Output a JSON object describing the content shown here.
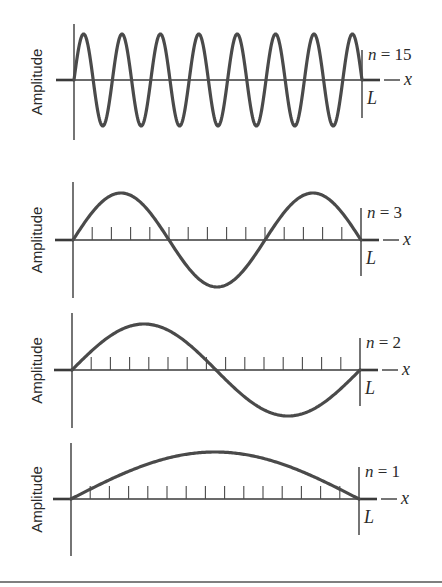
{
  "figure": {
    "y_axis_label": "Amplitude",
    "x_axis_label": "x",
    "length_label": "L",
    "colors": {
      "curve": "#4a4a4a",
      "axes": "#3a3a3a",
      "text": "#2a2a2a",
      "background": "#ffffff"
    }
  },
  "panels": [
    {
      "id": "n15",
      "mode_label_var": "n",
      "mode_label_eq": " = 15",
      "n": 15,
      "baseline_y": 80,
      "axis_x0": 74,
      "axis_x1": 362,
      "axis_top": 24,
      "axis_bottom": 140,
      "L_top": 50,
      "L_bottom": 118,
      "amplitude_px": 46,
      "ticks": false
    },
    {
      "id": "n3",
      "mode_label_var": "n",
      "mode_label_eq": " = 3",
      "n": 3,
      "baseline_y": 240,
      "axis_x0": 73,
      "axis_x1": 361,
      "axis_top": 182,
      "axis_bottom": 298,
      "L_top": 208,
      "L_bottom": 276,
      "amplitude_px": 47,
      "ticks": true
    },
    {
      "id": "n2",
      "mode_label_var": "n",
      "mode_label_eq": " = 2",
      "n": 2,
      "baseline_y": 370,
      "axis_x0": 72,
      "axis_x1": 360,
      "axis_top": 313,
      "axis_bottom": 428,
      "L_top": 338,
      "L_bottom": 406,
      "amplitude_px": 46,
      "ticks": true
    },
    {
      "id": "n1",
      "mode_label_var": "n",
      "mode_label_eq": " = 1",
      "n": 1,
      "baseline_y": 499,
      "axis_x0": 71,
      "axis_x1": 359,
      "axis_top": 443,
      "axis_bottom": 556,
      "L_top": 467,
      "L_bottom": 535,
      "amplitude_px": 47,
      "ticks": true
    }
  ],
  "tick_divisions": 15,
  "chart_data": {
    "type": "line",
    "title": "",
    "xlabel": "x",
    "ylabel": "Amplitude",
    "x_range": [
      0,
      "L"
    ],
    "series": [
      {
        "name": "n = 15",
        "function": "sin(15*pi*x/L)",
        "half_wavelengths": 15,
        "nodes": 16,
        "antinodes": 15
      },
      {
        "name": "n = 3",
        "function": "sin(3*pi*x/L)",
        "half_wavelengths": 3,
        "nodes": 4,
        "antinodes": 3
      },
      {
        "name": "n = 2",
        "function": "sin(2*pi*x/L)",
        "half_wavelengths": 2,
        "nodes": 3,
        "antinodes": 2
      },
      {
        "name": "n = 1",
        "function": "sin(pi*x/L)",
        "half_wavelengths": 1,
        "nodes": 2,
        "antinodes": 1
      }
    ],
    "x_ticks_between_0_and_L": 14,
    "grid": false,
    "legend": "inline labels at right of each panel"
  }
}
